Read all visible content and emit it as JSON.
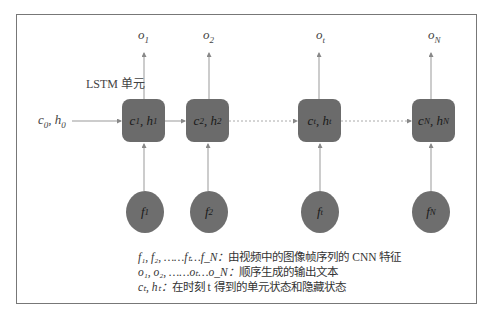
{
  "diagram": {
    "unit_label": "LSTM 单元",
    "initial_state": {
      "base": "c",
      "sub": "0",
      "base2": "h",
      "sub2": "0"
    },
    "cells": [
      {
        "id": "1",
        "state": "c1, h1",
        "c_sub": "1",
        "h_sub": "1",
        "output": "o",
        "output_sub": "1",
        "feature": "f",
        "feature_sub": "1"
      },
      {
        "id": "2",
        "state": "c2, h2",
        "c_sub": "2",
        "h_sub": "2",
        "output": "o",
        "output_sub": "2",
        "feature": "f",
        "feature_sub": "2"
      },
      {
        "id": "t",
        "state": "ct, ht",
        "c_sub": "t",
        "h_sub": "t",
        "output": "o",
        "output_sub": "t",
        "feature": "f",
        "feature_sub": "t"
      },
      {
        "id": "N",
        "state": "cN, hN",
        "c_sub": "N",
        "h_sub": "N",
        "output": "o",
        "output_sub": "N",
        "feature": "f",
        "feature_sub": "N"
      }
    ],
    "colors": {
      "cell_fill": "#6b6b6b",
      "feature_fill": "#6e6e6e",
      "line": "#888888",
      "frame": "#777777"
    }
  },
  "legend": [
    {
      "symbol": "f₁, f₂, ……fₜ…f_N：",
      "text": "由视频中的图像帧序列的 CNN 特征"
    },
    {
      "symbol": "o₁, o₂, ……oₜ…o_N：",
      "text": "顺序生成的输出文本"
    },
    {
      "symbol": "cₜ, hₜ：",
      "text": "在时刻 t 得到的单元状态和隐藏状态"
    }
  ]
}
